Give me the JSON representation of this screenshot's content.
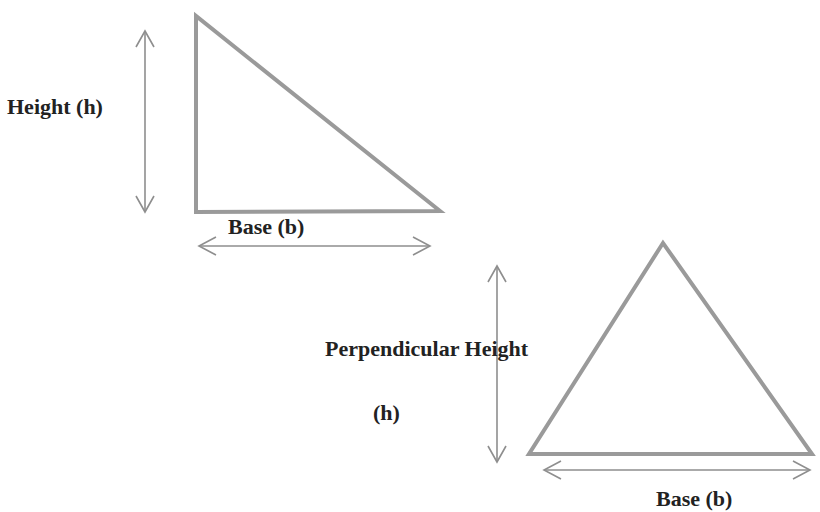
{
  "diagram": {
    "stroke_color": "#9a9a9a",
    "text_color": "#222222",
    "right_triangle": {
      "vertices": [
        [
          196,
          16
        ],
        [
          196,
          212
        ],
        [
          440,
          211
        ]
      ],
      "height_label": "Height (h)",
      "base_label": "Base (b)",
      "height_arrow": {
        "x": 145,
        "y1": 30,
        "y2": 213
      },
      "base_arrow": {
        "y": 246,
        "x1": 198,
        "x2": 430
      }
    },
    "isosceles_triangle": {
      "vertices": [
        [
          663,
          243
        ],
        [
          529,
          454
        ],
        [
          812,
          454
        ]
      ],
      "height_label_line1": "Perpendicular Height",
      "height_label_line2": "(h)",
      "base_label": "Base (b)",
      "height_arrow": {
        "x": 497,
        "y1": 265,
        "y2": 462
      },
      "base_arrow": {
        "y": 470,
        "x1": 543,
        "x2": 810
      }
    }
  }
}
